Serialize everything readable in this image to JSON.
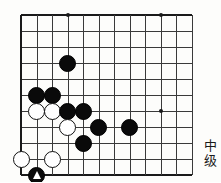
{
  "page": {
    "type": "go-board-diagram",
    "width": 221,
    "height": 182
  },
  "board": {
    "name": "go-board",
    "cols": 12,
    "rows": 11,
    "origin_x": 21,
    "origin_y": 15,
    "spacing_x": 15.5,
    "spacing_y": 16,
    "line_color": "#3a3a3a",
    "edge_color": "#1a1a1a",
    "background": "#fdfdfb",
    "star_points": [
      {
        "name": "star-point-1",
        "col": 4,
        "row": 1
      },
      {
        "name": "star-point-2",
        "col": 10,
        "row": 1
      },
      {
        "name": "star-point-3",
        "col": 10,
        "row": 7
      }
    ],
    "stones": [
      {
        "name": "black-stone-d4",
        "color": "black",
        "col": 4,
        "row": 4,
        "mark": ""
      },
      {
        "name": "black-stone-b6",
        "color": "black",
        "col": 2,
        "row": 6,
        "mark": ""
      },
      {
        "name": "black-stone-c6",
        "color": "black",
        "col": 3,
        "row": 6,
        "mark": ""
      },
      {
        "name": "white-stone-b7",
        "color": "white",
        "col": 2,
        "row": 7,
        "mark": ""
      },
      {
        "name": "white-stone-c7",
        "color": "white",
        "col": 3,
        "row": 7,
        "mark": ""
      },
      {
        "name": "black-stone-d7",
        "color": "black",
        "col": 4,
        "row": 7,
        "mark": ""
      },
      {
        "name": "black-stone-e7",
        "color": "black",
        "col": 5,
        "row": 7,
        "mark": ""
      },
      {
        "name": "white-stone-d8",
        "color": "white",
        "col": 4,
        "row": 8,
        "mark": ""
      },
      {
        "name": "black-stone-f8",
        "color": "black",
        "col": 6,
        "row": 8,
        "mark": ""
      },
      {
        "name": "black-stone-h8",
        "color": "black",
        "col": 8,
        "row": 8,
        "mark": ""
      },
      {
        "name": "black-stone-e9",
        "color": "black",
        "col": 5,
        "row": 9,
        "mark": ""
      },
      {
        "name": "white-stone-a10",
        "color": "white",
        "col": 1,
        "row": 10,
        "mark": ""
      },
      {
        "name": "white-stone-c10",
        "color": "white",
        "col": 3,
        "row": 10,
        "mark": ""
      },
      {
        "name": "black-stone-b11-marked",
        "color": "black",
        "col": 2,
        "row": 11,
        "mark": "triangle"
      }
    ]
  },
  "side_label": {
    "name": "difficulty-label",
    "text": "中级",
    "chars": [
      "中",
      "级"
    ]
  }
}
